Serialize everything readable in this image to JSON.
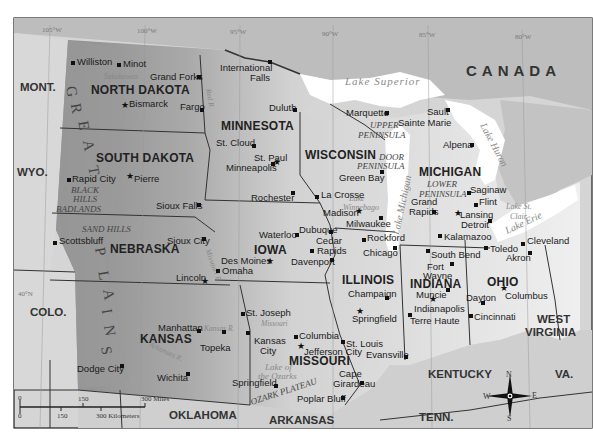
{
  "map": {
    "country_label": "CANADA",
    "states": [
      {
        "name": "NORTH DAKOTA",
        "x": 91,
        "y": 84
      },
      {
        "name": "SOUTH DAKOTA",
        "x": 96,
        "y": 152
      },
      {
        "name": "NEBRASKA",
        "x": 110,
        "y": 243
      },
      {
        "name": "KANSAS",
        "x": 140,
        "y": 333
      },
      {
        "name": "MINNESOTA",
        "x": 221,
        "y": 120
      },
      {
        "name": "IOWA",
        "x": 254,
        "y": 244
      },
      {
        "name": "MISSOURI",
        "x": 289,
        "y": 355
      },
      {
        "name": "WISCONSIN",
        "x": 305,
        "y": 149
      },
      {
        "name": "ILLINOIS",
        "x": 342,
        "y": 274
      },
      {
        "name": "MICHIGAN",
        "x": 419,
        "y": 166
      },
      {
        "name": "INDIANA",
        "x": 410,
        "y": 278
      },
      {
        "name": "OHIO",
        "x": 487,
        "y": 276
      }
    ],
    "neighbors": [
      {
        "name": "MONT.",
        "x": 20,
        "y": 82
      },
      {
        "name": "WYO.",
        "x": 17,
        "y": 167
      },
      {
        "name": "COLO.",
        "x": 30,
        "y": 307
      },
      {
        "name": "OKLAHOMA",
        "x": 169,
        "y": 410
      },
      {
        "name": "ARKANSAS",
        "x": 269,
        "y": 415
      },
      {
        "name": "KENTUCKY",
        "x": 428,
        "y": 369
      },
      {
        "name": "TENN.",
        "x": 419,
        "y": 412
      },
      {
        "name": "WEST",
        "x": 537,
        "y": 314
      },
      {
        "name": "VIRGINIA",
        "x": 525,
        "y": 327
      },
      {
        "name": "VA.",
        "x": 555,
        "y": 369
      }
    ],
    "cities": [
      {
        "name": "Williston",
        "x": 77,
        "y": 57,
        "dot": [
          73,
          63
        ],
        "type": "dot"
      },
      {
        "name": "Minot",
        "x": 123,
        "y": 59,
        "dot": [
          119,
          65
        ],
        "type": "dot"
      },
      {
        "name": "Grand Forks",
        "x": 150,
        "y": 72,
        "dot": [
          199,
          77
        ],
        "type": "dot"
      },
      {
        "name": "Bismarck",
        "x": 129,
        "y": 99,
        "dot": [
          125,
          106
        ],
        "type": "star"
      },
      {
        "name": "Fargo",
        "x": 180,
        "y": 102,
        "dot": [
          202,
          110
        ],
        "type": "dot"
      },
      {
        "name": "International",
        "x": 220,
        "y": 63,
        "dot": [
          270,
          62
        ],
        "type": "dot"
      },
      {
        "name": "Falls",
        "x": 250,
        "y": 73
      },
      {
        "name": "Duluth",
        "x": 269,
        "y": 103,
        "dot": [
          295,
          110
        ],
        "type": "dot"
      },
      {
        "name": "St. Cloud",
        "x": 216,
        "y": 138,
        "dot": [
          254,
          146
        ],
        "type": "dot"
      },
      {
        "name": "St. Paul",
        "x": 254,
        "y": 153,
        "dot": [
          277,
          163
        ],
        "type": "star"
      },
      {
        "name": "Minneapolis",
        "x": 226,
        "y": 163,
        "dot": [
          273,
          164
        ],
        "type": "dot"
      },
      {
        "name": "Rochester",
        "x": 251,
        "y": 193,
        "dot": [
          293,
          193
        ],
        "type": "dot"
      },
      {
        "name": "La Crosse",
        "x": 321,
        "y": 190,
        "dot": [
          317,
          197
        ],
        "type": "dot"
      },
      {
        "name": "Green Bay",
        "x": 339,
        "y": 173,
        "dot": [
          382,
          172
        ],
        "type": "dot"
      },
      {
        "name": "Madison",
        "x": 323,
        "y": 208,
        "dot": [
          359,
          212
        ],
        "type": "star"
      },
      {
        "name": "Milwaukee",
        "x": 346,
        "y": 219,
        "dot": [
          381,
          218
        ],
        "type": "dot"
      },
      {
        "name": "Dubuque",
        "x": 299,
        "y": 225,
        "dot": [
          331,
          232
        ],
        "type": "dot"
      },
      {
        "name": "Waterloo",
        "x": 259,
        "y": 230,
        "dot": [
          297,
          235
        ],
        "type": "dot"
      },
      {
        "name": "Cedar",
        "x": 316,
        "y": 236
      },
      {
        "name": "Rapids",
        "x": 317,
        "y": 246,
        "dot": [
          312,
          251
        ],
        "type": "dot"
      },
      {
        "name": "Davenport",
        "x": 291,
        "y": 257,
        "dot": [
          332,
          260
        ],
        "type": "dot"
      },
      {
        "name": "Des Moines",
        "x": 221,
        "y": 256,
        "dot": [
          270,
          262
        ],
        "type": "star"
      },
      {
        "name": "Omaha",
        "x": 222,
        "y": 266,
        "dot": [
          218,
          271
        ],
        "type": "dot"
      },
      {
        "name": "Rockford",
        "x": 367,
        "y": 233,
        "dot": [
          364,
          240
        ],
        "type": "dot"
      },
      {
        "name": "Chicago",
        "x": 363,
        "y": 248,
        "dot": [
          395,
          248
        ],
        "type": "dot"
      },
      {
        "name": "Marquette",
        "x": 346,
        "y": 108,
        "dot": [
          387,
          113
        ],
        "type": "dot"
      },
      {
        "name": "Sault",
        "x": 427,
        "y": 107,
        "dot": [
          448,
          110
        ],
        "type": "dot"
      },
      {
        "name": "Sainte Marie",
        "x": 398,
        "y": 118
      },
      {
        "name": "Alpena",
        "x": 443,
        "y": 140,
        "dot": [
          472,
          145
        ],
        "type": "dot"
      },
      {
        "name": "Saginaw",
        "x": 470,
        "y": 185,
        "dot": [
          469,
          193
        ],
        "type": "dot"
      },
      {
        "name": "Flint",
        "x": 479,
        "y": 197,
        "dot": [
          476,
          205
        ],
        "type": "dot"
      },
      {
        "name": "Grand",
        "x": 411,
        "y": 197
      },
      {
        "name": "Rapids",
        "x": 409,
        "y": 207,
        "dot": [
          434,
          212
        ],
        "type": "dot"
      },
      {
        "name": "Lansing",
        "x": 460,
        "y": 210,
        "dot": [
          458,
          214
        ],
        "type": "star"
      },
      {
        "name": "Detroit",
        "x": 461,
        "y": 220,
        "dot": [
          490,
          221
        ],
        "type": "dot"
      },
      {
        "name": "Kalamazoo",
        "x": 444,
        "y": 232,
        "dot": [
          440,
          236
        ],
        "type": "dot"
      },
      {
        "name": "Toledo",
        "x": 490,
        "y": 244,
        "dot": [
          486,
          248
        ],
        "type": "dot"
      },
      {
        "name": "Cleveland",
        "x": 527,
        "y": 236,
        "dot": [
          523,
          244
        ],
        "type": "dot"
      },
      {
        "name": "Akron",
        "x": 506,
        "y": 253,
        "dot": [
          530,
          253
        ],
        "type": "dot"
      },
      {
        "name": "South Bend",
        "x": 431,
        "y": 250,
        "dot": [
          428,
          251
        ],
        "type": "dot"
      },
      {
        "name": "Fort",
        "x": 427,
        "y": 262,
        "dot": [
          452,
          264
        ],
        "type": "dot"
      },
      {
        "name": "Wayne",
        "x": 423,
        "y": 271
      },
      {
        "name": "Muncie",
        "x": 416,
        "y": 290,
        "dot": [
          448,
          290
        ],
        "type": "dot"
      },
      {
        "name": "Indianapolis",
        "x": 414,
        "y": 304,
        "dot": [
          433,
          300
        ],
        "type": "star"
      },
      {
        "name": "Terre Haute",
        "x": 410,
        "y": 316,
        "dot": [
          410,
          315
        ],
        "type": "dot"
      },
      {
        "name": "Dayton",
        "x": 466,
        "y": 293,
        "dot": [
          483,
          303
        ],
        "type": "dot"
      },
      {
        "name": "Columbus",
        "x": 505,
        "y": 291,
        "dot": [
          504,
          289
        ],
        "type": "star"
      },
      {
        "name": "Cincinnati",
        "x": 474,
        "y": 312,
        "dot": [
          471,
          316
        ],
        "type": "dot"
      },
      {
        "name": "Champaign",
        "x": 348,
        "y": 289,
        "dot": [
          387,
          298
        ],
        "type": "dot"
      },
      {
        "name": "Springfield",
        "x": 352,
        "y": 314,
        "dot": [
          360,
          312
        ],
        "type": "star"
      },
      {
        "name": "Evansville",
        "x": 366,
        "y": 350,
        "dot": [
          406,
          357
        ],
        "type": "dot"
      },
      {
        "name": "St. Louis",
        "x": 346,
        "y": 339,
        "dot": [
          343,
          342
        ],
        "type": "dot"
      },
      {
        "name": "Columbia",
        "x": 299,
        "y": 331,
        "dot": [
          296,
          337
        ],
        "type": "dot"
      },
      {
        "name": "Jefferson City",
        "x": 304,
        "y": 347,
        "dot": [
          301,
          347
        ],
        "type": "star"
      },
      {
        "name": "Cape",
        "x": 339,
        "y": 369
      },
      {
        "name": "Girardeau",
        "x": 333,
        "y": 379,
        "dot": [
          362,
          383
        ],
        "type": "dot"
      },
      {
        "name": "Poplar Bluff",
        "x": 297,
        "y": 394,
        "dot": [
          343,
          398
        ],
        "type": "dot"
      },
      {
        "name": "Springfield",
        "x": 232,
        "y": 378,
        "dot": [
          276,
          386
        ],
        "type": "dot"
      },
      {
        "name": "St. Joseph",
        "x": 246,
        "y": 308,
        "dot": [
          243,
          314
        ],
        "type": "dot"
      },
      {
        "name": "Kansas",
        "x": 254,
        "y": 336,
        "dot": [
          248,
          333
        ],
        "type": "dot"
      },
      {
        "name": "City",
        "x": 260,
        "y": 346
      },
      {
        "name": "Topeka",
        "x": 200,
        "y": 343,
        "dot": [
          224,
          332
        ],
        "type": "dot"
      },
      {
        "name": "Manhattan",
        "x": 158,
        "y": 323,
        "dot": [
          199,
          331
        ],
        "type": "dot"
      },
      {
        "name": "Wichita",
        "x": 157,
        "y": 373,
        "dot": [
          188,
          374
        ],
        "type": "dot"
      },
      {
        "name": "Dodge City",
        "x": 77,
        "y": 364,
        "dot": [
          122,
          366
        ],
        "type": "dot"
      },
      {
        "name": "Lincoln",
        "x": 176,
        "y": 273,
        "dot": [
          205,
          282
        ],
        "type": "star"
      },
      {
        "name": "Sioux City",
        "x": 167,
        "y": 236,
        "dot": [
          204,
          239
        ],
        "type": "dot"
      },
      {
        "name": "Sioux Falls",
        "x": 156,
        "y": 201,
        "dot": [
          199,
          205
        ],
        "type": "dot"
      },
      {
        "name": "Pierre",
        "x": 134,
        "y": 174,
        "dot": [
          130,
          177
        ],
        "type": "star"
      },
      {
        "name": "Rapid City",
        "x": 72,
        "y": 174,
        "dot": [
          69,
          180
        ],
        "type": "dot"
      },
      {
        "name": "Scottsbluff",
        "x": 59,
        "y": 236,
        "dot": [
          55,
          243
        ],
        "type": "dot"
      }
    ],
    "regions": [
      {
        "name": "UPPER",
        "x": 370,
        "y": 121
      },
      {
        "name": "PENINSULA",
        "x": 358,
        "y": 131
      },
      {
        "name": "DOOR",
        "x": 379,
        "y": 153
      },
      {
        "name": "PENINSULA",
        "x": 357,
        "y": 162
      },
      {
        "name": "LOWER",
        "x": 427,
        "y": 180
      },
      {
        "name": "PENINSULA",
        "x": 419,
        "y": 190
      },
      {
        "name": "BLACK",
        "x": 71,
        "y": 186
      },
      {
        "name": "HILLS",
        "x": 73,
        "y": 195
      },
      {
        "name": "BADLANDS",
        "x": 56,
        "y": 205
      },
      {
        "name": "SAND HILLS",
        "x": 82,
        "y": 225
      },
      {
        "name": "Lake of",
        "x": 265,
        "y": 363
      },
      {
        "name": "the Ozarks",
        "x": 258,
        "y": 372
      },
      {
        "name": "OZARK PLATEAU",
        "x": 251,
        "y": 398
      }
    ],
    "water": [
      {
        "name": "Lake Superior",
        "x": 345,
        "y": 76,
        "cls": "waterlake"
      },
      {
        "name": "Lake Michigan",
        "x": 392,
        "y": 245,
        "rot": -78,
        "cls": "water"
      },
      {
        "name": "Lake Huron",
        "x": 477,
        "y": 130,
        "rot": 62,
        "cls": "water"
      },
      {
        "name": "Lake Erie",
        "x": 504,
        "y": 218,
        "rot": -25,
        "cls": "water"
      },
      {
        "name": "Lake St.",
        "x": 506,
        "y": 203,
        "cls": "water"
      },
      {
        "name": "Clair",
        "x": 510,
        "y": 213,
        "cls": "water"
      },
      {
        "name": "Lake",
        "x": 349,
        "y": 195,
        "cls": "water"
      },
      {
        "name": "Winnebago",
        "x": 343,
        "y": 204,
        "cls": "water"
      }
    ],
    "rivers": [
      {
        "name": "Sakakawea",
        "x": 104,
        "y": 73
      },
      {
        "name": "Missouri R.",
        "x": 196,
        "y": 262,
        "rot": 70
      },
      {
        "name": "Kansas R.",
        "x": 204,
        "y": 325
      },
      {
        "name": "Missouri",
        "x": 261,
        "y": 320
      },
      {
        "name": "Arkansas R.",
        "x": 148,
        "y": 348,
        "rot": 25
      },
      {
        "name": "Red R.",
        "x": 205,
        "y": 95,
        "rot": 80
      }
    ],
    "plains_letters": [
      {
        "ch": "G",
        "x": 66,
        "y": 84
      },
      {
        "ch": "R",
        "x": 71,
        "y": 101
      },
      {
        "ch": "E",
        "x": 79,
        "y": 118
      },
      {
        "ch": "A",
        "x": 83,
        "y": 138
      },
      {
        "ch": "T",
        "x": 89,
        "y": 163
      },
      {
        "ch": "P",
        "x": 96,
        "y": 244
      },
      {
        "ch": "L",
        "x": 99,
        "y": 268
      },
      {
        "ch": "A",
        "x": 103,
        "y": 287
      },
      {
        "ch": "I",
        "x": 104,
        "y": 304
      },
      {
        "ch": "N",
        "x": 104,
        "y": 323
      },
      {
        "ch": "S",
        "x": 102,
        "y": 343
      }
    ],
    "longitudes": [
      {
        "label": "105°W",
        "x": 42,
        "y": 27
      },
      {
        "label": "100°W",
        "x": 137,
        "y": 28
      },
      {
        "label": "95°W",
        "x": 230,
        "y": 29
      },
      {
        "label": "90°W",
        "x": 322,
        "y": 31
      },
      {
        "label": "85°W",
        "x": 419,
        "y": 32
      },
      {
        "label": "80°W",
        "x": 515,
        "y": 34
      }
    ],
    "left_lat_label": "40°N",
    "scale": {
      "miles_ticks": [
        "0",
        "150",
        "300 Miles"
      ],
      "km_ticks": [
        "0",
        "150",
        "300 Kilometers"
      ]
    },
    "compass": {
      "n": "N",
      "s": "S",
      "e": "E",
      "w": "W"
    },
    "colors": {
      "canada": "#b9b9b9",
      "neighbor": "#d6d6d6",
      "plains_dark": "#8e8e8e",
      "plains_mid": "#a8a8a8",
      "midwest": "#eeeeee",
      "lake": "#ffffff",
      "border": "#333333"
    }
  }
}
